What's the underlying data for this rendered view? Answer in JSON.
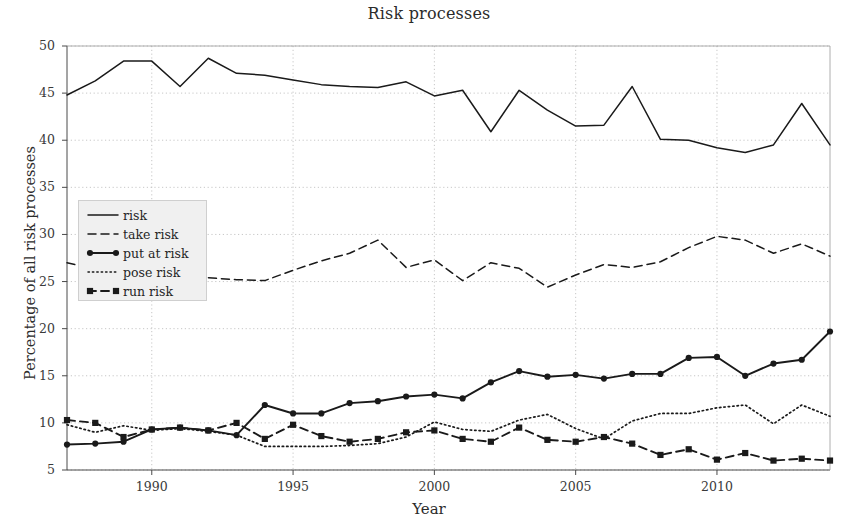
{
  "chart_data": {
    "type": "line",
    "title": "Risk processes",
    "xlabel": "Year",
    "ylabel": "Percentage of all risk processes",
    "xlim": [
      1987,
      2014
    ],
    "ylim": [
      5,
      50
    ],
    "grid": true,
    "legend_position": "left-middle",
    "xticks": [
      1990,
      1995,
      2000,
      2005,
      2010
    ],
    "xtick_labels": [
      "1990",
      "1995",
      "2000",
      "2005",
      "2010"
    ],
    "yticks": [
      5,
      10,
      15,
      20,
      25,
      30,
      35,
      40,
      45,
      50
    ],
    "ytick_labels": [
      "5",
      "10",
      "15",
      "20",
      "25",
      "30",
      "35",
      "40",
      "45",
      "50"
    ],
    "x": [
      1987,
      1988,
      1989,
      1990,
      1991,
      1992,
      1993,
      1994,
      1995,
      1996,
      1997,
      1998,
      1999,
      2000,
      2001,
      2002,
      2003,
      2004,
      2005,
      2006,
      2007,
      2008,
      2009,
      2010,
      2011,
      2012,
      2013,
      2014
    ],
    "series": [
      {
        "name": "risk",
        "style": "solid",
        "marker": "none",
        "color": "#1a1a1a",
        "values": [
          44.8,
          46.3,
          48.4,
          48.4,
          45.7,
          48.7,
          47.1,
          46.9,
          46.4,
          45.9,
          45.7,
          45.6,
          46.2,
          44.7,
          45.3,
          40.9,
          45.3,
          43.2,
          41.5,
          41.6,
          45.7,
          40.1,
          40.0,
          39.2,
          38.7,
          39.5,
          43.9,
          39.5
        ]
      },
      {
        "name": "take risk",
        "style": "dashed",
        "marker": "none",
        "color": "#1a1a1a",
        "values": [
          27.0,
          26.3,
          25.8,
          25.3,
          25.4,
          25.4,
          25.2,
          25.1,
          26.2,
          27.2,
          28.0,
          29.4,
          26.5,
          27.3,
          25.1,
          27.0,
          26.4,
          24.4,
          25.7,
          26.8,
          26.5,
          27.1,
          28.6,
          29.8,
          29.4,
          28.0,
          29.0,
          27.7
        ]
      },
      {
        "name": "put at risk",
        "style": "solid",
        "marker": "circle",
        "color": "#1a1a1a",
        "values": [
          7.7,
          7.8,
          8.0,
          9.3,
          9.5,
          9.2,
          8.7,
          11.9,
          11.0,
          11.0,
          12.1,
          12.3,
          12.8,
          13.0,
          12.6,
          14.3,
          15.5,
          14.9,
          15.1,
          14.7,
          15.2,
          15.2,
          16.9,
          17.0,
          15.0,
          16.3,
          16.7,
          19.7
        ]
      },
      {
        "name": "pose risk",
        "style": "dotted",
        "marker": "none",
        "color": "#1a1a1a",
        "values": [
          9.8,
          9.0,
          9.7,
          9.2,
          9.4,
          9.1,
          8.7,
          7.5,
          7.5,
          7.5,
          7.6,
          7.8,
          8.5,
          10.1,
          9.3,
          9.1,
          10.3,
          10.9,
          9.4,
          8.3,
          10.2,
          11.0,
          11.0,
          11.6,
          11.9,
          9.9,
          11.9,
          10.7
        ]
      },
      {
        "name": "run risk",
        "style": "dashed",
        "marker": "square",
        "color": "#1a1a1a",
        "values": [
          10.3,
          10.0,
          8.5,
          9.3,
          9.5,
          9.2,
          10.0,
          8.3,
          9.8,
          8.6,
          8.0,
          8.3,
          9.0,
          9.2,
          8.3,
          8.0,
          9.5,
          8.2,
          8.0,
          8.5,
          7.8,
          6.6,
          7.2,
          6.1,
          6.8,
          6.0,
          6.2,
          6.0
        ]
      }
    ]
  },
  "legend": {
    "items": [
      {
        "label": "risk"
      },
      {
        "label": "take risk"
      },
      {
        "label": "put at risk"
      },
      {
        "label": "pose risk"
      },
      {
        "label": "run risk"
      }
    ]
  }
}
